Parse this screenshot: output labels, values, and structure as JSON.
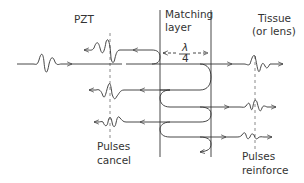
{
  "diagram": {
    "regions": {
      "left": "PZT",
      "middle_line1": "Matching",
      "middle_line2": "layer",
      "right_line1": "Tissue",
      "right_line2": "(or lens)"
    },
    "thickness_label": {
      "numerator": "λ",
      "denominator": "4"
    },
    "annotations": {
      "left_line1": "Pulses",
      "left_line2": "cancel",
      "right_line1": "Pulses",
      "right_line2": "reinforce"
    },
    "colors": {
      "stroke": "#333333",
      "dashed": "#8a8a8a",
      "background": "#ffffff"
    }
  }
}
